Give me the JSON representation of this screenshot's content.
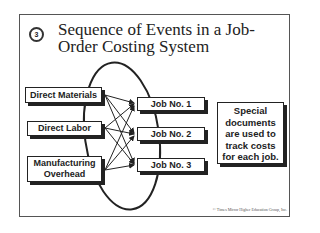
{
  "slide": {
    "number_badge": "3",
    "title": "Sequence of Events in a Job-Order Costing System",
    "title_lines": [
      "Sequence of Events in a Job-",
      "Order Costing System"
    ],
    "copyright": "© Times Mirror Higher Education Group, Inc."
  },
  "diagram": {
    "sources": [
      {
        "label": "Direct Materials"
      },
      {
        "label": "Direct Labor"
      },
      {
        "label": "Manufacturing Overhead",
        "lines": [
          "Manufacturing",
          "Overhead"
        ]
      }
    ],
    "jobs": [
      {
        "label": "Job No. 1"
      },
      {
        "label": "Job No. 2"
      },
      {
        "label": "Job No. 3"
      }
    ],
    "note": {
      "text": "Special documents are used to track costs for each job.",
      "lines": [
        "Special",
        "documents",
        "are used to",
        "track costs",
        "for each job."
      ]
    },
    "connections": "each source flows to every job (3×3 arrows)"
  }
}
